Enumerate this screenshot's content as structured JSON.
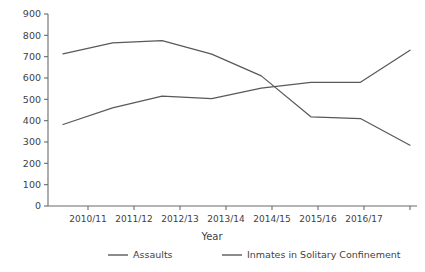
{
  "chart_data": {
    "type": "line",
    "title": "",
    "xlabel": "Year",
    "ylabel": "",
    "categories": [
      "2010/11",
      "2011/12",
      "2012/13",
      "2013/14",
      "2014/15",
      "2015/16",
      "2016/17",
      ""
    ],
    "ylim": [
      0,
      900
    ],
    "ytick_labels": [
      "900",
      "800",
      "700",
      "600",
      "500",
      "400",
      "300",
      "200",
      "100",
      "0"
    ],
    "ytick_values": [
      900,
      800,
      700,
      600,
      500,
      400,
      300,
      200,
      100,
      0
    ],
    "grid": false,
    "legend_position": "bottom",
    "series": [
      {
        "name": "Assaults",
        "color": "#595959",
        "values": [
          382,
          460,
          515,
          503,
          553,
          580,
          580,
          730
        ]
      },
      {
        "name": "Inmates in Solitary Confinement",
        "color": "#595959",
        "values": [
          713,
          765,
          775,
          712,
          610,
          418,
          410,
          285
        ]
      }
    ]
  },
  "axes": {
    "x_axis_label": "Year",
    "y_axis_label": ""
  },
  "legend": {
    "items": [
      {
        "label": "Assaults",
        "color": "#595959"
      },
      {
        "label": "Inmates in Solitary Confinement",
        "color": "#595959"
      }
    ]
  },
  "colors": {
    "background": "#ffffff",
    "axis": "#6b6b6b",
    "text": "#3f3f3f",
    "series": "#595959"
  }
}
